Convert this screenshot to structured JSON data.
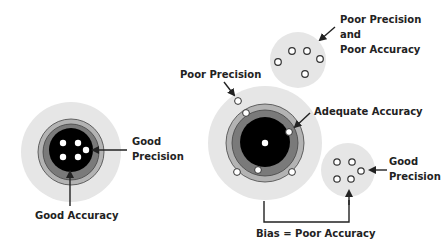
{
  "colors": {
    "halo": "#e6e6e6",
    "ring_outer": "#b3b3b3",
    "ring_inner": "#7a7a7a",
    "bullseye": "#000000",
    "stroke": "#333333",
    "dot": "#ffffff",
    "text": "#222222"
  },
  "left_target": {
    "good_precision_label_line1": "Good",
    "good_precision_label_line2": "Precision",
    "good_accuracy_label": "Good Accuracy"
  },
  "center_target": {
    "poor_precision_label": "Poor Precision",
    "adequate_accuracy_label": "Adequate Accuracy"
  },
  "top_right_cluster": {
    "label_line1": "Poor Precision",
    "label_line2": "and",
    "label_line3": "Poor Accuracy"
  },
  "bottom_right_cluster": {
    "label_line1": "Good",
    "label_line2": "Precision"
  },
  "bias_label": "Bias = Poor Accuracy"
}
